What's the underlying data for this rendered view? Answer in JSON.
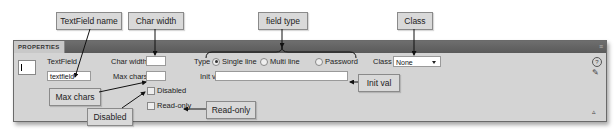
{
  "panel": {
    "title": "PROPERTIES",
    "menu_icon": "panel-menu-icon",
    "field_icon": "textfield-icon",
    "name_label": "TextField",
    "name_value": "textfield",
    "char_width_label": "Char width",
    "char_width_value": "",
    "max_chars_label": "Max chars",
    "max_chars_value": "",
    "type_label": "Type",
    "type_options": [
      {
        "label": "Single line",
        "selected": true
      },
      {
        "label": "Multi line",
        "selected": false
      },
      {
        "label": "Password",
        "selected": false
      }
    ],
    "init_val_label": "Init val",
    "init_val_value": "",
    "class_label": "Class",
    "class_value": "None",
    "disabled_label": "Disabled",
    "disabled_checked": false,
    "readonly_label": "Read-only",
    "readonly_checked": false,
    "help_icon": "?",
    "edit_icon": "✎",
    "collapse_icon": "▵"
  },
  "callouts": {
    "textfield_name": "TextField name",
    "char_width": "Char width",
    "field_type": "field type",
    "class": "Class",
    "init_val": "Init val",
    "max_chars": "Max chars",
    "disabled": "Disabled",
    "read_only": "Read-only"
  }
}
